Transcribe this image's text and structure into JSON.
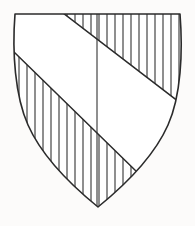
{
  "figure": {
    "name": "heraldic-shield",
    "caption": ""
  },
  "canvas": {
    "width": 195,
    "height": 226,
    "background_color": "#fcfbfa"
  },
  "style": {
    "outline_color": "#2b2b2b",
    "outline_width": 1.6,
    "band_edge_color": "#2b2b2b",
    "band_edge_width": 1.5,
    "hatch_color": "#333333",
    "hatch_width": 1.1,
    "field_fill": "#ffffff",
    "band_fill": "#ffffff"
  },
  "shield": {
    "shape": "heater",
    "top_left": [
      15,
      14
    ],
    "top_right": [
      180,
      14
    ],
    "bottom_point": [
      98,
      207
    ],
    "left_bulge_x": 12,
    "right_bulge_x": 183,
    "outline_path": "M 15 14 L 180 14 C 183 52 181 96 168 125 C 156 152 130 181 98 207 C 66 181 40 152 28 125 C 15 96 12 52 15 14 Z"
  },
  "bend": {
    "name": "bend-sinister",
    "tincture": "plain",
    "hatched": false,
    "upper_edge": {
      "from": [
        63,
        13
      ],
      "to": [
        183,
        105
      ]
    },
    "lower_edge": {
      "from": [
        14,
        52
      ],
      "to": [
        138,
        173
      ]
    },
    "clip_path": "M 63 13 L 183 105 L 183 118 L 138 173 L 14 52 L 14 13 Z"
  },
  "hatching": {
    "name": "vertical-hatching",
    "meaning": "gules",
    "orientation": "vertical",
    "spacing_px": 8,
    "start_x": 19,
    "count": 21,
    "line_x_positions": [
      19,
      27,
      35,
      43,
      51,
      59,
      67,
      75,
      83,
      91,
      99,
      107,
      115,
      123,
      131,
      139,
      147,
      155,
      163,
      171,
      179
    ]
  },
  "center_line": {
    "name": "pale-center-line",
    "x": 97,
    "from_y": 14,
    "to_y": 207
  }
}
